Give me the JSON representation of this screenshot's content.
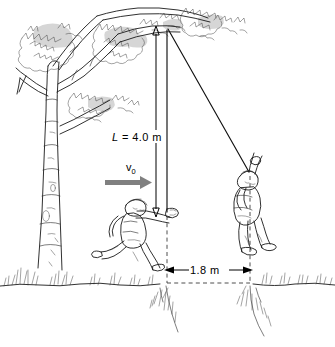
{
  "figure": {
    "type": "physics-diagram"
  },
  "labels": {
    "rope_length": {
      "symbol": "L",
      "equals": "=",
      "value": "4.0 m",
      "full": "L = 4.0 m"
    },
    "initial_velocity": {
      "symbol": "v",
      "subscript": "0",
      "full": "v0"
    },
    "horizontal_distance": {
      "value": "1.8 m"
    }
  },
  "elements": {
    "tree": "birch-tree",
    "runner": "running-boy",
    "swinger": "swinging-boy",
    "ground": "ground-line",
    "ravine": "ravine-gap",
    "pivot": "rope-anchor-point"
  },
  "colors": {
    "ink": "#1a1a1a",
    "leaf_shade": "#d6d6d6",
    "velocity_arrow": "#808080",
    "dimension": "#000000",
    "background": "#ffffff"
  }
}
